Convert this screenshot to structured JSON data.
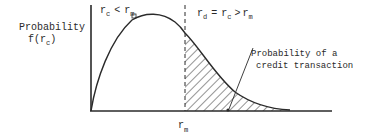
{
  "diagram": {
    "y_axis_label_line1": "Probability",
    "y_axis_label_line2_main": "f(r",
    "y_axis_label_line2_sub": "c",
    "y_axis_label_line2_close": ")",
    "left_region_label": {
      "r1": "r",
      "sub1": "c",
      "op": "<",
      "r2": "r",
      "sub2": "m"
    },
    "right_region_label": {
      "r1": "r",
      "sub1": "d",
      "eq": "=",
      "r2": "r",
      "sub2": "c",
      "op": ">",
      "r3": "r",
      "sub3": "m"
    },
    "shaded_area_label_line1": "Probability of a",
    "shaded_area_label_line2": "credit transaction",
    "x_marker_main": "r",
    "x_marker_sub": "m",
    "colors": {
      "ink": "#2a2a2a",
      "background": "#ffffff"
    }
  }
}
